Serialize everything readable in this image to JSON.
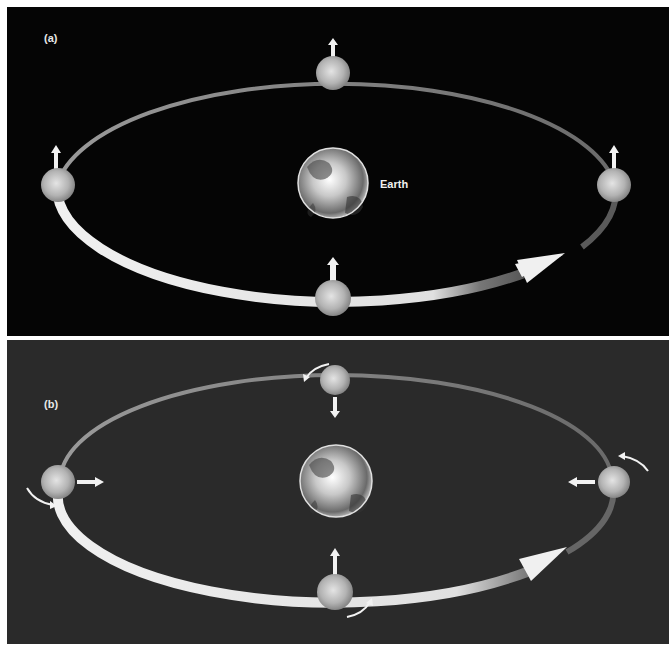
{
  "panels": [
    {
      "id": "a",
      "label": "(a)",
      "background": "#050505",
      "earth_label": "Earth",
      "description": "Moon orbiting Earth without rotation; arrows all point in the same direction"
    },
    {
      "id": "b",
      "label": "(b)",
      "background": "#2a2a2a",
      "earth_label": "",
      "description": "Moon orbiting Earth with synchronous rotation; arrows always point toward Earth"
    }
  ],
  "colors": {
    "orbit_light": "#e6e6e6",
    "orbit_dark": "#555555",
    "arrow": "#f2f2f2",
    "moon": "#bdbdbd",
    "earth": "#cfcfcf"
  },
  "icons": {
    "moon": "moon-icon",
    "earth": "earth-icon",
    "direction_arrow": "arrow-icon",
    "rotation_arrow": "curved-arrow-icon"
  }
}
